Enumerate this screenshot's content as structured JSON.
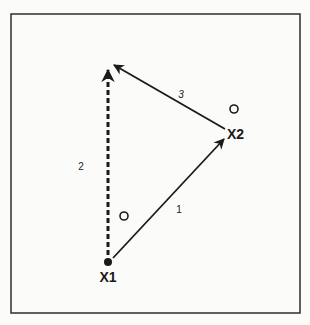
{
  "diagram": {
    "frame": {
      "x": 11,
      "y": 14,
      "width": 289,
      "height": 299,
      "stroke": "#3a3a3a"
    },
    "colors": {
      "ink": "#1a1a1a",
      "background": "#fbfbfa"
    },
    "points": {
      "x1": {
        "label": "X1",
        "x": 108,
        "y": 262
      },
      "x2": {
        "label": "X2",
        "x": 226,
        "y": 134
      }
    },
    "vectors": [
      {
        "id": "1",
        "label": "1",
        "from": "X1",
        "to": "X2",
        "style": "solid"
      },
      {
        "id": "2",
        "label": "2",
        "from": "X1",
        "to": "top",
        "style": "dashed"
      },
      {
        "id": "3",
        "label": "3",
        "from": "X2",
        "to": "top",
        "style": "solid"
      }
    ],
    "open_circles": [
      {
        "x": 234,
        "y": 109,
        "r": 4
      },
      {
        "x": 124,
        "y": 216,
        "r": 4
      }
    ],
    "labels": {
      "x1": "X1",
      "x2": "X2",
      "vector_1": "1",
      "vector_2": "2",
      "vector_3": "3"
    }
  }
}
